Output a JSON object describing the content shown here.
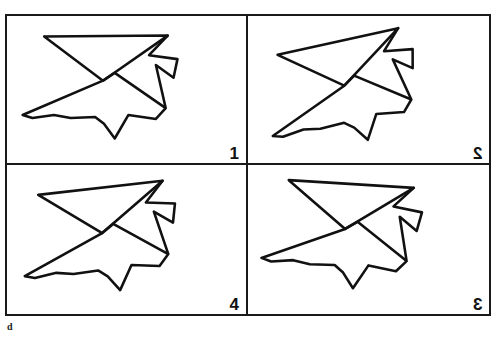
{
  "figure": {
    "caption": "d",
    "background_color": "#ffffff",
    "stroke_color": "#111111",
    "border_color": "#1a1a1a",
    "panels": [
      {
        "id": "panel-1",
        "label": "1",
        "label_mirrored": false,
        "position": "top-left",
        "rotation_deg": 0,
        "mirrored": false
      },
      {
        "id": "panel-2",
        "label": "2",
        "label_mirrored": true,
        "position": "top-right",
        "rotation_deg": -12,
        "mirrored": false
      },
      {
        "id": "panel-4",
        "label": "4",
        "label_mirrored": false,
        "position": "bottom-left",
        "rotation_deg": -6,
        "mirrored": false
      },
      {
        "id": "panel-3",
        "label": "3",
        "label_mirrored": true,
        "position": "bottom-right",
        "rotation_deg": 4,
        "mirrored": false
      }
    ],
    "shape": {
      "name": "abstract-polyline-figure",
      "description": "closed angular star/bowtie polyline drawn with a single black stroke",
      "viewbox": "0 0 240 150",
      "path": "M 36 21 L 162 20 L 96 66 L 36 21 M 162 20 L 143 40 L 172 44 L 168 63 L 150 50 L 160 94 L 108 58 L 96 66 L 14 101 L 24 104 L 46 101 L 63 104 L 88 103 L 97 110 L 108 125 L 122 101 L 150 105 L 160 94"
    }
  }
}
